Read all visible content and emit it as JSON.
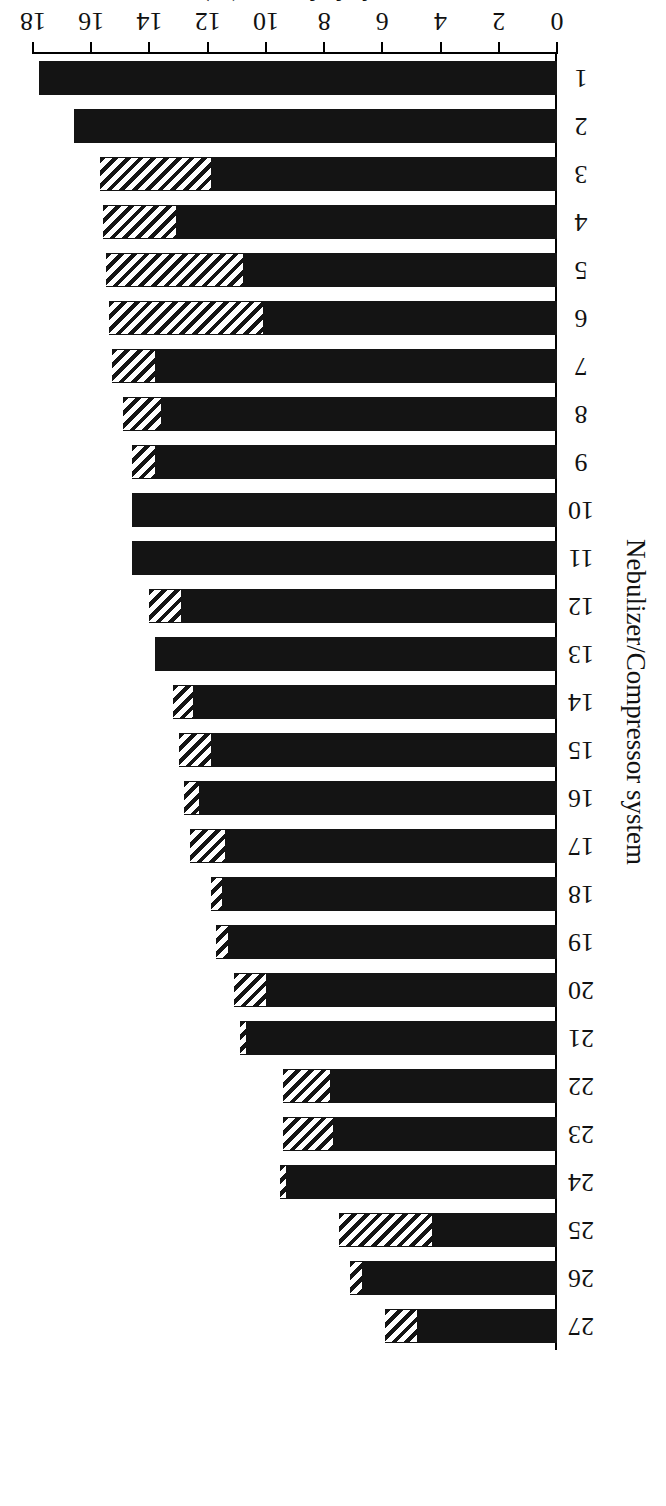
{
  "chart_data": {
    "type": "bar",
    "orientation": "horizontal-bars-drawn-rotated-180",
    "title": "",
    "xlabel": "Nebulizer/Compressor system",
    "ylabel": "Inhaled mass (%)",
    "ylim": [
      0,
      18
    ],
    "yticks": [
      0,
      2,
      4,
      6,
      8,
      10,
      12,
      14,
      16,
      18
    ],
    "ytick_labels": [
      "0",
      "2",
      "4",
      "6",
      "8",
      "10",
      "12",
      "14",
      "16",
      "18"
    ],
    "grid": false,
    "legend": "none",
    "stacked": true,
    "categories": [
      "1",
      "2",
      "3",
      "4",
      "5",
      "6",
      "7",
      "8",
      "9",
      "10",
      "11",
      "12",
      "13",
      "14",
      "15",
      "16",
      "17",
      "18",
      "19",
      "20",
      "21",
      "22",
      "23",
      "24",
      "25",
      "26",
      "27"
    ],
    "series": [
      {
        "name": "solid-segment",
        "pattern": "solid-black",
        "color": "#141414",
        "values": [
          17.8,
          16.6,
          11.9,
          13.1,
          10.8,
          10.1,
          13.8,
          13.6,
          13.8,
          14.6,
          14.6,
          12.9,
          13.8,
          12.5,
          11.9,
          12.3,
          11.4,
          11.5,
          11.3,
          10.0,
          10.7,
          7.8,
          7.7,
          9.3,
          4.3,
          6.7,
          4.8
        ]
      },
      {
        "name": "hatched-segment",
        "pattern": "diagonal-hatch",
        "color": "#141414",
        "values": [
          0.0,
          0.0,
          3.8,
          2.5,
          4.7,
          5.3,
          1.5,
          1.3,
          0.8,
          0.0,
          0.0,
          1.1,
          0.0,
          0.7,
          1.1,
          0.5,
          1.2,
          0.4,
          0.4,
          1.1,
          0.2,
          1.6,
          1.7,
          0.2,
          3.2,
          0.4,
          1.1
        ]
      }
    ],
    "totals": [
      17.8,
      16.6,
      15.7,
      15.6,
      15.5,
      15.4,
      15.3,
      14.9,
      14.6,
      14.6,
      14.6,
      14.0,
      13.8,
      13.2,
      13.0,
      12.8,
      12.6,
      11.9,
      11.7,
      11.1,
      10.9,
      9.4,
      9.4,
      9.5,
      7.5,
      7.1,
      5.9
    ]
  },
  "figure": {
    "value_axis_title": "Inhaled mass (%)",
    "category_axis_title": "Nebulizer/Compressor system",
    "page_mark": "6"
  }
}
